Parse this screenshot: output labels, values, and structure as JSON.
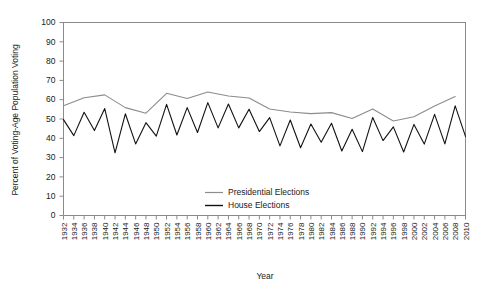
{
  "chart_data": {
    "type": "line",
    "title": "",
    "xlabel": "Year",
    "ylabel": "Percent of Voting-Age Population Voting",
    "ylim": [
      0,
      100
    ],
    "xlim": [
      1932,
      2010
    ],
    "ytick_step": 10,
    "xtick_step": 2,
    "grid": false,
    "legend_position": "center",
    "yticks": [
      0,
      10,
      20,
      30,
      40,
      50,
      60,
      70,
      80,
      90,
      100
    ],
    "xticks": [
      1932,
      1934,
      1936,
      1938,
      1940,
      1942,
      1944,
      1946,
      1948,
      1950,
      1952,
      1954,
      1956,
      1958,
      1960,
      1962,
      1964,
      1966,
      1968,
      1970,
      1972,
      1974,
      1976,
      1978,
      1980,
      1982,
      1984,
      1986,
      1988,
      1990,
      1992,
      1994,
      1996,
      1998,
      2000,
      2002,
      2004,
      2006,
      2008,
      2010
    ],
    "series": [
      {
        "name": "Presidential Elections",
        "color": "#8c8c8c",
        "x": [
          1932,
          1936,
          1940,
          1944,
          1948,
          1952,
          1956,
          1960,
          1964,
          1968,
          1972,
          1976,
          1980,
          1984,
          1988,
          1992,
          1996,
          2000,
          2004,
          2008
        ],
        "values": [
          56.9,
          61.0,
          62.5,
          55.9,
          53.0,
          63.3,
          60.6,
          64.0,
          61.9,
          60.9,
          55.2,
          53.6,
          52.8,
          53.3,
          50.3,
          55.2,
          49.0,
          51.2,
          56.7,
          61.6
        ]
      },
      {
        "name": "House Elections",
        "color": "#111111",
        "x": [
          1932,
          1934,
          1936,
          1938,
          1940,
          1942,
          1944,
          1946,
          1948,
          1950,
          1952,
          1954,
          1956,
          1958,
          1960,
          1962,
          1964,
          1966,
          1968,
          1970,
          1972,
          1974,
          1976,
          1978,
          1980,
          1982,
          1984,
          1986,
          1988,
          1990,
          1992,
          1994,
          1996,
          1998,
          2000,
          2002,
          2004,
          2006,
          2008,
          2010
        ],
        "values": [
          49.7,
          41.4,
          53.5,
          44.0,
          55.4,
          32.5,
          52.7,
          37.1,
          48.1,
          41.1,
          57.6,
          41.7,
          55.9,
          43.0,
          58.5,
          45.4,
          57.8,
          45.4,
          55.1,
          43.5,
          50.7,
          36.1,
          49.5,
          35.1,
          47.4,
          38.0,
          47.8,
          33.4,
          44.7,
          33.1,
          50.8,
          38.8,
          45.9,
          32.9,
          47.2,
          37.0,
          52.4,
          37.1,
          56.8,
          41.0
        ]
      }
    ]
  },
  "legend": {
    "entries": [
      {
        "label": "Presidential Elections"
      },
      {
        "label": "House Elections"
      }
    ]
  }
}
